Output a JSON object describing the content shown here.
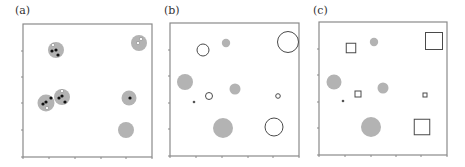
{
  "chart_data": [
    {
      "type": "scatter",
      "panel": "a",
      "title": "(a)",
      "xlabel": "",
      "ylabel": "",
      "grid": false,
      "frame": {
        "x0": 23,
        "y0": 24,
        "x1": 152,
        "y1": 157
      },
      "x_ticks": [
        23,
        49,
        75,
        101,
        126,
        152
      ],
      "y_ticks": [
        51,
        77,
        103,
        130,
        157
      ],
      "clusters": [
        {
          "cx": 56,
          "cy": 50,
          "r": 8,
          "fill": "#b3b3b3",
          "points": [
            {
              "x": 53,
              "y": 45,
              "color": "white"
            },
            {
              "x": 52,
              "y": 51,
              "color": "black"
            },
            {
              "x": 56,
              "y": 50,
              "color": "black"
            },
            {
              "x": 58,
              "y": 55,
              "color": "black"
            }
          ]
        },
        {
          "cx": 139,
          "cy": 43,
          "r": 8,
          "fill": "#b3b3b3",
          "points": [
            {
              "x": 141,
              "y": 39,
              "color": "white"
            },
            {
              "x": 138,
              "y": 43,
              "color": "white"
            }
          ]
        },
        {
          "cx": 46,
          "cy": 103,
          "r": 8.5,
          "fill": "#b3b3b3",
          "points": [
            {
              "x": 43,
              "y": 104,
              "color": "black"
            },
            {
              "x": 46,
              "y": 102,
              "color": "black"
            },
            {
              "x": 51,
              "y": 98,
              "color": "black"
            },
            {
              "x": 47,
              "y": 108,
              "color": "white"
            }
          ]
        },
        {
          "cx": 62,
          "cy": 97,
          "r": 8,
          "fill": "#b3b3b3",
          "points": [
            {
              "x": 59,
              "y": 98,
              "color": "black"
            },
            {
              "x": 62,
              "y": 96,
              "color": "black"
            },
            {
              "x": 65,
              "y": 102,
              "color": "black"
            },
            {
              "x": 62,
              "y": 91,
              "color": "white"
            }
          ]
        },
        {
          "cx": 129,
          "cy": 98,
          "r": 7.5,
          "fill": "#b3b3b3",
          "points": [
            {
              "x": 130,
              "y": 98,
              "color": "black"
            }
          ]
        },
        {
          "cx": 126,
          "cy": 130,
          "r": 8,
          "fill": "#b3b3b3",
          "points": []
        }
      ]
    },
    {
      "type": "scatter",
      "panel": "b",
      "title": "(b)",
      "xlabel": "",
      "ylabel": "",
      "grid": false,
      "frame": {
        "x0": 170,
        "y0": 23,
        "x1": 299,
        "y1": 156
      },
      "x_ticks": [
        170,
        196,
        222,
        248,
        273,
        299
      ],
      "y_ticks": [
        50,
        76,
        103,
        129,
        156
      ],
      "markers": [
        {
          "shape": "circle",
          "style": "open",
          "cx": 203,
          "cy": 50,
          "r": 6
        },
        {
          "shape": "circle",
          "style": "filled",
          "cx": 226,
          "cy": 43,
          "r": 4.2
        },
        {
          "shape": "circle",
          "style": "open",
          "cx": 288,
          "cy": 42,
          "r": 10.5
        },
        {
          "shape": "circle",
          "style": "filled",
          "cx": 185,
          "cy": 82,
          "r": 8
        },
        {
          "shape": "circle",
          "style": "filled",
          "cx": 235,
          "cy": 89,
          "r": 5.5
        },
        {
          "shape": "circle",
          "style": "open",
          "cx": 209,
          "cy": 96,
          "r": 3.5
        },
        {
          "shape": "circle",
          "style": "open",
          "cx": 278,
          "cy": 96,
          "r": 2.3
        },
        {
          "shape": "circle",
          "style": "dot",
          "cx": 194,
          "cy": 102,
          "r": 1.3
        },
        {
          "shape": "circle",
          "style": "filled",
          "cx": 223,
          "cy": 128,
          "r": 10
        },
        {
          "shape": "circle",
          "style": "open",
          "cx": 274,
          "cy": 127,
          "r": 9
        }
      ]
    },
    {
      "type": "scatter",
      "panel": "c",
      "title": "(c)",
      "xlabel": "",
      "ylabel": "",
      "grid": false,
      "frame": {
        "x0": 319,
        "y0": 22,
        "x1": 447,
        "y1": 155
      },
      "x_ticks": [
        319,
        345,
        371,
        396,
        421,
        447
      ],
      "y_ticks": [
        49,
        75,
        102,
        128,
        155
      ],
      "markers": [
        {
          "shape": "square",
          "style": "open",
          "cx": 351,
          "cy": 48,
          "size": 9.5
        },
        {
          "shape": "circle",
          "style": "filled",
          "cx": 374,
          "cy": 42,
          "r": 4.2
        },
        {
          "shape": "square",
          "style": "open",
          "cx": 434,
          "cy": 41,
          "size": 17
        },
        {
          "shape": "circle",
          "style": "filled",
          "cx": 334,
          "cy": 82,
          "r": 7.5
        },
        {
          "shape": "circle",
          "style": "filled",
          "cx": 383,
          "cy": 88,
          "r": 5.5
        },
        {
          "shape": "square",
          "style": "open",
          "cx": 358,
          "cy": 94,
          "size": 6
        },
        {
          "shape": "square",
          "style": "open",
          "cx": 425,
          "cy": 95,
          "size": 4
        },
        {
          "shape": "circle",
          "style": "dot",
          "cx": 343,
          "cy": 101,
          "r": 1.3
        },
        {
          "shape": "circle",
          "style": "filled",
          "cx": 371,
          "cy": 127,
          "r": 10
        },
        {
          "shape": "square",
          "style": "open",
          "cx": 422,
          "cy": 127,
          "size": 15.5
        }
      ]
    }
  ],
  "panels": {
    "a": {
      "label": "(a)"
    },
    "b": {
      "label": "(b)"
    },
    "c": {
      "label": "(c)"
    }
  },
  "colors": {
    "gray_fill": "#b3b3b3",
    "open_stroke": "#4a4a4a",
    "dot_black": "#111111",
    "dot_white": "#ffffff",
    "frame": "#8a8a8a"
  }
}
